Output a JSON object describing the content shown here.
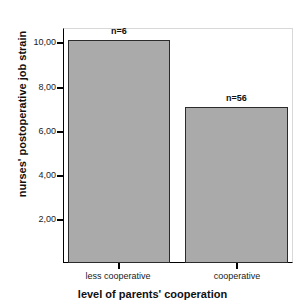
{
  "chart_data": {
    "type": "bar",
    "title": "",
    "subtitle": "",
    "categories": [
      "less cooperative",
      "cooperative"
    ],
    "values": [
      10.1,
      7.05
    ],
    "annotations": [
      "n=6",
      "n=56"
    ],
    "xlabel": "level of parents' cooperation",
    "ylabel": "nurses' postoperative job strain",
    "ylim": [
      0,
      10.65
    ],
    "yticks": [
      2,
      4,
      6,
      8,
      10
    ],
    "ytick_labels": [
      "2,00",
      "4,00",
      "6,00",
      "8,00",
      "10,00"
    ],
    "grid": false,
    "legend": false,
    "bar_fill_color": "#aaaaaa",
    "bar_edge_color": "#2b2b2b",
    "frame_color": "#000000",
    "background_color": "#ffffff"
  },
  "axes": {
    "y_title": "nurses' postoperative job strain",
    "x_title": "level of parents' cooperation",
    "y_tick_0": "2,00",
    "y_tick_1": "4,00",
    "y_tick_2": "6,00",
    "y_tick_3": "8,00",
    "y_tick_4": "10,00"
  },
  "bars": [
    {
      "category": "less cooperative",
      "value": 10.1,
      "annotation": "n=6"
    },
    {
      "category": "cooperative",
      "value": 7.05,
      "annotation": "n=56"
    }
  ]
}
